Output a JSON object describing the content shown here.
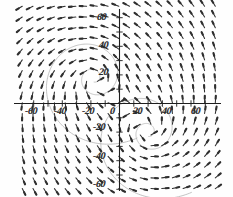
{
  "figure": {
    "title": "",
    "kind": "direction-field-plot"
  },
  "axes": {
    "x_tick_labels": [
      "-60",
      "-40",
      "-20",
      "0",
      "20",
      "40",
      "60"
    ],
    "y_tick_labels": [
      "60",
      "40",
      "20",
      "-20",
      "-40",
      "-60"
    ],
    "origin_label": "0"
  },
  "chart_data": {
    "type": "scatter",
    "subtype": "vector-field",
    "title": "",
    "xlabel": "",
    "ylabel": "",
    "xlim": [
      -75,
      75
    ],
    "ylim": [
      -75,
      75
    ],
    "xticks": [
      -60,
      -50,
      -40,
      -30,
      -20,
      -10,
      0,
      10,
      20,
      30,
      40,
      50,
      60
    ],
    "yticks": [
      -60,
      -50,
      -40,
      -30,
      -20,
      -10,
      0,
      10,
      20,
      30,
      40,
      50,
      60
    ],
    "xtick_labels": [
      -60,
      -40,
      -20,
      0,
      20,
      40,
      60
    ],
    "ytick_labels": [
      60,
      40,
      20,
      -20,
      -40,
      -60
    ],
    "grid": false,
    "legend": null,
    "axis_color": "#1a1a1a",
    "arrow_color": "#2a2a2a",
    "trajectory_color": "#9a9a9a",
    "background": "#ffffff",
    "field_domain": {
      "x": [
        -68,
        68
      ],
      "y": [
        -68,
        68
      ]
    },
    "field_spacing": 7.5,
    "arrow_length_px": 7,
    "critical_points": [
      {
        "x": -18,
        "y": 18,
        "type": "spiral-focus",
        "rotation": "counterclockwise"
      },
      {
        "x": 20,
        "y": -20,
        "type": "spiral-focus",
        "rotation": "counterclockwise"
      }
    ],
    "trajectories": [
      {
        "center": [
          -18,
          18
        ],
        "turns": 2.1,
        "r_start": 3,
        "r_end": 52
      },
      {
        "center": [
          20,
          -20
        ],
        "turns": 2.1,
        "r_start": 3,
        "r_end": 52
      }
    ],
    "series": [
      {
        "name": "direction-field",
        "values": []
      }
    ]
  }
}
